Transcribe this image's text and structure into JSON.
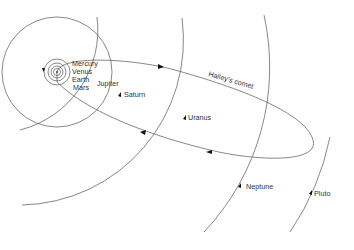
{
  "diagram": {
    "title": "",
    "labels": {
      "mercury": "Mercury",
      "venus": "Venus",
      "earth": "Earth",
      "mars": "Mars",
      "jupiter": "Jupiter",
      "saturn": "Saturn",
      "uranus": "Uranus",
      "neptune": "Neptune",
      "pluto": "Pluto",
      "comet": "Halley's comet"
    },
    "colors": {
      "line": "#555555",
      "arrow": "#111111",
      "text": "#333333",
      "background": "#ffffff"
    }
  }
}
